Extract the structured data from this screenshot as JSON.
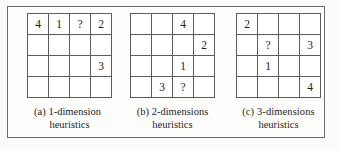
{
  "figure": {
    "border_color": "#6e6e6e",
    "grid_line_color": "#5c5c5c",
    "background": "#fdfdfc",
    "text_color": "#1d1d1d"
  },
  "panels": [
    {
      "id": "panel-a",
      "label": "(a) 1-dimension",
      "caption_line1": "(a) 1-dimension",
      "caption_line2": "heuristics",
      "grid": {
        "rows": 4,
        "cols": 4,
        "cells": [
          [
            "4",
            "1",
            "?",
            "2"
          ],
          [
            "",
            "",
            "",
            ""
          ],
          [
            "",
            "",
            "",
            "3"
          ],
          [
            "",
            "",
            "",
            ""
          ]
        ]
      }
    },
    {
      "id": "panel-b",
      "label": "(b) 2-dimensions",
      "caption_line1": "(b) 2-dimensions",
      "caption_line2": "heuristics",
      "grid": {
        "rows": 4,
        "cols": 4,
        "cells": [
          [
            "",
            "",
            "4",
            ""
          ],
          [
            "",
            "",
            "",
            "2"
          ],
          [
            "",
            "",
            "1",
            ""
          ],
          [
            "",
            "3",
            "?",
            ""
          ]
        ]
      }
    },
    {
      "id": "panel-c",
      "label": "(c) 3-dimensions",
      "caption_line1": "(c)  3-dimensions",
      "caption_line2": "heuristics",
      "grid": {
        "rows": 4,
        "cols": 4,
        "cells": [
          [
            "2",
            "",
            "",
            ""
          ],
          [
            "",
            "?",
            "",
            "3"
          ],
          [
            "",
            "1",
            "",
            ""
          ],
          [
            "",
            "",
            "",
            "4"
          ]
        ]
      }
    }
  ]
}
